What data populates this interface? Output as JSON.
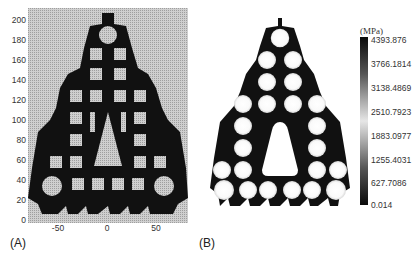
{
  "figure": {
    "panel_a": {
      "label": "(A)",
      "description": "Topology-optimized triangular lattice structure on a density grid",
      "y_axis": {
        "ticks": [
          "200",
          "180",
          "160",
          "140",
          "120",
          "100",
          "80",
          "60",
          "40",
          "20",
          "0"
        ],
        "range": [
          0,
          205
        ]
      },
      "x_axis": {
        "ticks": [
          "-50",
          "0",
          "50"
        ],
        "range": [
          -80,
          80
        ]
      },
      "colors": {
        "background_grid": "#c8c8c8",
        "grid_lines": "#a9a9a9",
        "solid": "#111111"
      }
    },
    "panel_b": {
      "label": "(B)",
      "description": "Von Mises stress distribution of the optimized structure",
      "colorbar": {
        "unit": "(MPa)",
        "labels": [
          "4393.876",
          "3766.1814",
          "3138.4869",
          "2510.7923",
          "1883.0977",
          "1255.4031",
          "627.7086",
          "0.014"
        ],
        "max": 4393.876,
        "min": 0.014,
        "gradient": [
          "#0a0a0a",
          "#555555",
          "#aaaaaa",
          "#e6e6e6",
          "#aaaaaa",
          "#555555",
          "#0a0a0a"
        ]
      },
      "colors": {
        "structure": "#111111",
        "holes": "#ffffff"
      }
    }
  }
}
